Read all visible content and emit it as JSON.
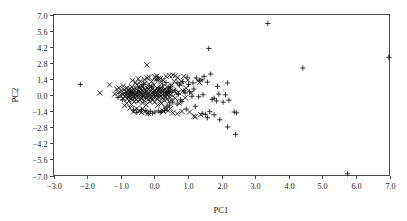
{
  "chart_data": {
    "type": "scatter",
    "title": "",
    "xlabel": "PC1",
    "ylabel": "PC2",
    "xlim": [
      -3.0,
      7.0
    ],
    "ylim": [
      -7.0,
      7.0
    ],
    "grid": false,
    "legend": "none",
    "xticks": [
      "-3.0",
      "-2.0",
      "-1.0",
      "0.0",
      "1.0",
      "2.0",
      "3.0",
      "4.0",
      "5.0",
      "6.0",
      "7.0"
    ],
    "xtick_values": [
      -3.0,
      -2.0,
      -1.0,
      0.0,
      1.0,
      2.0,
      3.0,
      4.0,
      5.0,
      6.0,
      7.0
    ],
    "yticks": [
      "7.0",
      "5.6",
      "4.2",
      "2.8",
      "1.4",
      "0.0",
      "-1.4",
      "-2.8",
      "-4.2",
      "-5.6",
      "-7.0"
    ],
    "ytick_values": [
      7.0,
      5.6,
      4.2,
      2.8,
      1.4,
      0.0,
      -1.4,
      -2.8,
      -4.2,
      -5.6,
      -7.0
    ],
    "marker_styles": {
      "cross": "x-shape",
      "plus": "plus-shape"
    },
    "series": [
      {
        "name": "group-x",
        "marker": "cross",
        "points": [
          [
            -1.62,
            0.19
          ],
          [
            -1.33,
            0.88
          ],
          [
            -1.12,
            0.52
          ],
          [
            -1.06,
            0.22
          ],
          [
            -1.02,
            -0.05
          ],
          [
            -0.98,
            0.35
          ],
          [
            -0.95,
            0.05
          ],
          [
            -0.93,
            -0.28
          ],
          [
            -0.9,
            0.45
          ],
          [
            -0.88,
            0.12
          ],
          [
            -0.86,
            -0.12
          ],
          [
            -0.84,
            0.3
          ],
          [
            -0.83,
            -0.02
          ],
          [
            -0.81,
            0.62
          ],
          [
            -0.8,
            -0.35
          ],
          [
            -0.79,
            0.18
          ],
          [
            -0.78,
            -0.18
          ],
          [
            -0.77,
            0.4
          ],
          [
            -0.76,
            0.02
          ],
          [
            -0.75,
            -0.5
          ],
          [
            -0.74,
            0.25
          ],
          [
            -0.73,
            -0.08
          ],
          [
            -0.72,
            0.55
          ],
          [
            -0.71,
            0.1
          ],
          [
            -0.7,
            -0.3
          ],
          [
            -0.69,
            0.33
          ],
          [
            -0.68,
            -0.02
          ],
          [
            -0.67,
            0.72
          ],
          [
            -0.66,
            0.15
          ],
          [
            -0.65,
            -0.42
          ],
          [
            -0.64,
            0.05
          ],
          [
            -0.63,
            0.28
          ],
          [
            -0.62,
            -0.15
          ],
          [
            -0.61,
            0.48
          ],
          [
            -0.6,
            -0.6
          ],
          [
            -0.59,
            0.08
          ],
          [
            -0.58,
            0.35
          ],
          [
            -0.57,
            -0.25
          ],
          [
            -0.56,
            0.6
          ],
          [
            -0.55,
            0.0
          ],
          [
            -0.54,
            -0.38
          ],
          [
            -0.53,
            0.22
          ],
          [
            -0.52,
            0.9
          ],
          [
            -0.51,
            -0.1
          ],
          [
            -0.5,
            0.42
          ],
          [
            -0.49,
            -0.55
          ],
          [
            -0.48,
            0.12
          ],
          [
            -0.47,
            0.3
          ],
          [
            -0.46,
            -0.2
          ],
          [
            -0.45,
            0.68
          ],
          [
            -0.44,
            0.02
          ],
          [
            -0.43,
            -0.45
          ],
          [
            -0.42,
            0.25
          ],
          [
            -0.41,
            0.5
          ],
          [
            -0.4,
            -0.05
          ],
          [
            -0.39,
            0.15
          ],
          [
            -0.38,
            -0.32
          ],
          [
            -0.37,
            0.8
          ],
          [
            -0.36,
            0.08
          ],
          [
            -0.35,
            -0.7
          ],
          [
            -0.34,
            0.38
          ],
          [
            -0.33,
            -0.12
          ],
          [
            -0.32,
            0.55
          ],
          [
            -0.31,
            0.0
          ],
          [
            -0.3,
            -0.48
          ],
          [
            -0.29,
            0.2
          ],
          [
            -0.28,
            1.02
          ],
          [
            -0.27,
            -0.22
          ],
          [
            -0.26,
            0.45
          ],
          [
            -0.25,
            0.05
          ],
          [
            -0.24,
            -0.85
          ],
          [
            -0.23,
            0.32
          ],
          [
            -0.22,
            2.62
          ],
          [
            -0.21,
            0.62
          ],
          [
            -0.2,
            -0.15
          ],
          [
            -0.19,
            0.1
          ],
          [
            -0.18,
            -0.38
          ],
          [
            -0.17,
            0.48
          ],
          [
            -0.16,
            0.95
          ],
          [
            -0.15,
            -0.05
          ],
          [
            -0.14,
            0.25
          ],
          [
            -0.13,
            -0.58
          ],
          [
            -0.12,
            0.7
          ],
          [
            -0.11,
            0.02
          ],
          [
            -0.1,
            -0.28
          ],
          [
            -0.09,
            0.4
          ],
          [
            -0.08,
            1.18
          ],
          [
            -0.07,
            -0.12
          ],
          [
            -0.06,
            0.18
          ],
          [
            -0.05,
            -0.45
          ],
          [
            -0.04,
            0.55
          ],
          [
            -0.03,
            0.08
          ],
          [
            -0.02,
            -0.2
          ],
          [
            -0.01,
            0.88
          ],
          [
            0.0,
            0.3
          ],
          [
            0.01,
            -0.62
          ],
          [
            0.02,
            0.12
          ],
          [
            0.03,
            0.45
          ],
          [
            0.04,
            -0.08
          ],
          [
            0.05,
            1.35
          ],
          [
            0.06,
            0.22
          ],
          [
            0.07,
            -0.32
          ],
          [
            0.08,
            0.6
          ],
          [
            0.09,
            0.0
          ],
          [
            0.1,
            -0.9
          ],
          [
            0.11,
            0.35
          ],
          [
            0.12,
            1.45
          ],
          [
            0.13,
            -0.18
          ],
          [
            0.14,
            0.5
          ],
          [
            0.15,
            0.05
          ],
          [
            0.16,
            -0.52
          ],
          [
            0.17,
            0.28
          ],
          [
            0.18,
            1.12
          ],
          [
            0.19,
            -0.1
          ],
          [
            0.2,
            0.42
          ],
          [
            0.21,
            0.15
          ],
          [
            0.22,
            -0.72
          ],
          [
            0.23,
            0.65
          ],
          [
            0.24,
            0.02
          ],
          [
            0.25,
            -0.25
          ],
          [
            0.26,
            0.38
          ],
          [
            0.27,
            1.28
          ],
          [
            0.28,
            -0.42
          ],
          [
            0.29,
            0.2
          ],
          [
            0.3,
            0.08
          ],
          [
            0.31,
            -1.05
          ],
          [
            0.32,
            0.52
          ],
          [
            0.33,
            0.3
          ],
          [
            0.34,
            -0.15
          ],
          [
            0.35,
            1.62
          ],
          [
            0.36,
            0.1
          ],
          [
            0.37,
            -0.35
          ],
          [
            0.38,
            0.72
          ],
          [
            0.39,
            -0.02
          ],
          [
            0.4,
            0.25
          ],
          [
            0.41,
            -1.35
          ],
          [
            0.42,
            0.45
          ],
          [
            0.43,
            0.12
          ],
          [
            0.44,
            -0.58
          ],
          [
            0.45,
            1.7
          ],
          [
            0.46,
            0.32
          ],
          [
            0.47,
            -0.22
          ],
          [
            0.48,
            0.58
          ],
          [
            0.49,
            0.05
          ],
          [
            0.5,
            -0.48
          ],
          [
            0.52,
            0.85
          ],
          [
            0.55,
            -1.55
          ],
          [
            0.58,
            0.4
          ],
          [
            0.6,
            1.2
          ],
          [
            0.62,
            -0.28
          ],
          [
            0.65,
            0.15
          ],
          [
            0.68,
            -1.62
          ],
          [
            0.7,
            1.52
          ],
          [
            0.72,
            0.22
          ],
          [
            0.75,
            -0.72
          ],
          [
            0.78,
            0.95
          ],
          [
            0.8,
            1.18
          ],
          [
            0.82,
            -1.42
          ],
          [
            0.85,
            0.35
          ],
          [
            0.88,
            1.62
          ],
          [
            0.92,
            -0.25
          ],
          [
            0.95,
            0.6
          ],
          [
            1.0,
            1.28
          ],
          [
            1.05,
            -1.48
          ],
          [
            1.1,
            0.18
          ],
          [
            1.18,
            -1.85
          ],
          [
            1.22,
            -1.9
          ],
          [
            1.3,
            1.25
          ],
          [
            1.35,
            1.08
          ],
          [
            1.38,
            -1.72
          ],
          [
            -0.88,
            -0.92
          ],
          [
            -0.72,
            -1.12
          ],
          [
            -0.58,
            -1.28
          ],
          [
            -0.45,
            -1.38
          ],
          [
            -0.38,
            -1.52
          ],
          [
            -0.28,
            -1.45
          ],
          [
            -0.18,
            -1.58
          ],
          [
            -0.52,
            -1.18
          ],
          [
            -0.62,
            -1.48
          ],
          [
            -0.35,
            -1.22
          ],
          [
            -0.65,
            1.25
          ],
          [
            -0.48,
            1.42
          ],
          [
            -0.3,
            1.35
          ],
          [
            -0.15,
            1.55
          ],
          [
            0.02,
            1.58
          ],
          [
            -0.55,
            1.08
          ],
          [
            -0.42,
            1.18
          ],
          [
            -0.22,
            1.48
          ],
          [
            0.08,
            1.65
          ],
          [
            0.18,
            1.42
          ],
          [
            -1.18,
            0.08
          ],
          [
            -1.05,
            0.62
          ],
          [
            -0.92,
            0.78
          ],
          [
            -0.82,
            -0.72
          ],
          [
            -0.68,
            -0.82
          ],
          [
            0.55,
            1.72
          ],
          [
            0.62,
            1.68
          ],
          [
            0.48,
            -1.18
          ],
          [
            0.35,
            -1.28
          ],
          [
            0.28,
            -1.42
          ]
        ]
      },
      {
        "name": "group-plus",
        "marker": "plus",
        "points": [
          [
            -2.2,
            0.92
          ],
          [
            3.38,
            6.22
          ],
          [
            6.98,
            3.28
          ],
          [
            5.75,
            -6.85
          ],
          [
            4.42,
            2.35
          ],
          [
            1.62,
            4.05
          ],
          [
            1.68,
            1.82
          ],
          [
            2.18,
            1.05
          ],
          [
            1.88,
            0.75
          ],
          [
            1.92,
            0.08
          ],
          [
            2.22,
            -0.45
          ],
          [
            2.12,
            0.02
          ],
          [
            1.78,
            -0.28
          ],
          [
            2.38,
            -1.48
          ],
          [
            2.45,
            -1.55
          ],
          [
            2.18,
            -2.78
          ],
          [
            2.42,
            -3.42
          ],
          [
            1.95,
            -2.15
          ],
          [
            1.58,
            -1.98
          ],
          [
            1.42,
            -1.62
          ],
          [
            1.52,
            -1.68
          ],
          [
            1.22,
            -0.98
          ],
          [
            1.35,
            1.28
          ],
          [
            1.42,
            1.32
          ],
          [
            1.48,
            1.62
          ],
          [
            1.58,
            1.12
          ],
          [
            1.25,
            1.48
          ],
          [
            0.98,
            1.55
          ],
          [
            0.88,
            0.35
          ],
          [
            0.92,
            0.18
          ],
          [
            0.78,
            -0.42
          ],
          [
            0.82,
            -0.55
          ],
          [
            0.72,
            0.08
          ],
          [
            0.68,
            -0.78
          ],
          [
            0.55,
            -0.62
          ],
          [
            0.45,
            -0.88
          ],
          [
            0.38,
            -1.05
          ],
          [
            0.3,
            -1.35
          ],
          [
            0.22,
            -1.42
          ],
          [
            0.12,
            -1.38
          ],
          [
            0.02,
            -1.48
          ],
          [
            -0.12,
            -1.42
          ],
          [
            -0.25,
            -1.35
          ],
          [
            -0.38,
            -1.28
          ],
          [
            -0.52,
            -1.52
          ],
          [
            -0.62,
            -1.32
          ],
          [
            -0.18,
            -1.62
          ],
          [
            -0.05,
            -1.58
          ],
          [
            0.18,
            -1.52
          ],
          [
            0.08,
            1.32
          ],
          [
            0.35,
            1.08
          ],
          [
            0.48,
            0.72
          ],
          [
            0.62,
            0.42
          ],
          [
            0.52,
            0.25
          ],
          [
            0.42,
            0.52
          ],
          [
            1.05,
            0.28
          ],
          [
            1.12,
            -0.12
          ],
          [
            1.18,
            0.52
          ],
          [
            1.32,
            -0.15
          ],
          [
            1.45,
            0.02
          ],
          [
            1.72,
            -0.38
          ],
          [
            1.85,
            -0.52
          ],
          [
            2.05,
            -0.62
          ],
          [
            1.65,
            -1.45
          ],
          [
            1.78,
            -1.72
          ],
          [
            0.25,
            0.88
          ],
          [
            0.15,
            0.62
          ],
          [
            -0.08,
            0.72
          ],
          [
            -0.32,
            0.92
          ],
          [
            -0.45,
            0.68
          ],
          [
            0.68,
            1.05
          ],
          [
            0.75,
            0.85
          ],
          [
            0.85,
            1.15
          ],
          [
            1.02,
            0.92
          ],
          [
            1.15,
            1.05
          ],
          [
            -0.72,
            0.38
          ],
          [
            -0.85,
            0.15
          ],
          [
            -0.95,
            -0.42
          ],
          [
            -1.08,
            -0.22
          ],
          [
            0.95,
            -1.22
          ]
        ]
      }
    ]
  },
  "axes": {
    "x_title": "PC1",
    "y_title": "PC2"
  }
}
